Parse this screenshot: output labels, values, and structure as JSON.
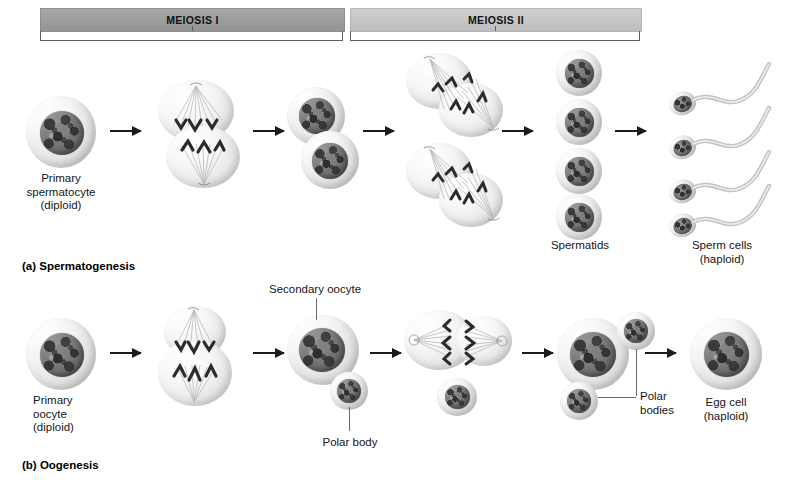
{
  "diagram": {
    "phases": [
      {
        "id": "meiosis-1",
        "label": "MEIOSIS I",
        "bar_color": "#9c9c9c"
      },
      {
        "id": "meiosis-2",
        "label": "MEIOSIS II",
        "bar_color": "#c5c5c5"
      }
    ],
    "panels": [
      {
        "id": "spermatogenesis",
        "caption": "(a) Spermatogenesis",
        "labels": [
          {
            "id": "primary-spermatocyte",
            "text": "Primary\nspermatocyte\n(diploid)"
          },
          {
            "id": "spermatids",
            "text": "Spermatids"
          },
          {
            "id": "sperm-cells",
            "text": "Sperm cells\n(haploid)"
          }
        ]
      },
      {
        "id": "oogenesis",
        "caption": "(b) Oogenesis",
        "labels": [
          {
            "id": "primary-oocyte",
            "text": "Primary\noocyte\n(diploid)"
          },
          {
            "id": "secondary-oocyte",
            "text": "Secondary oocyte"
          },
          {
            "id": "polar-body",
            "text": "Polar body"
          },
          {
            "id": "polar-bodies",
            "text": "Polar\nbodies"
          },
          {
            "id": "egg-cell",
            "text": "Egg cell\n(haploid)"
          }
        ]
      }
    ],
    "colors": {
      "cytoplasm": "#e8e8e8",
      "nucleus": "#6e6e6e",
      "arrow": "#1b1b1b",
      "leader": "#6a6a6a",
      "text": "#161616"
    }
  }
}
